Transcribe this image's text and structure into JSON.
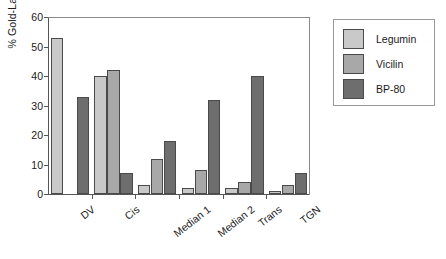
{
  "chart_data": {
    "type": "bar",
    "title": "",
    "xlabel": "",
    "ylabel": "% Gold-Label",
    "ylim": [
      0,
      60
    ],
    "yticks": [
      0,
      10,
      20,
      30,
      40,
      50,
      60
    ],
    "grid": false,
    "legend_position": "right-outside",
    "categories": [
      "DV",
      "Cis",
      "Median 1",
      "Median 2",
      "Trans",
      "TGN"
    ],
    "series": [
      {
        "name": "Legumin",
        "color": "#c9c9c9",
        "values": [
          53,
          40,
          3,
          2,
          2,
          1
        ]
      },
      {
        "name": "Vicilin",
        "color": "#a8a8a8",
        "values": [
          0,
          42,
          12,
          8,
          4,
          3
        ]
      },
      {
        "name": "BP-80",
        "color": "#6e6e6e",
        "values": [
          33,
          7,
          18,
          32,
          40,
          7
        ]
      }
    ]
  }
}
